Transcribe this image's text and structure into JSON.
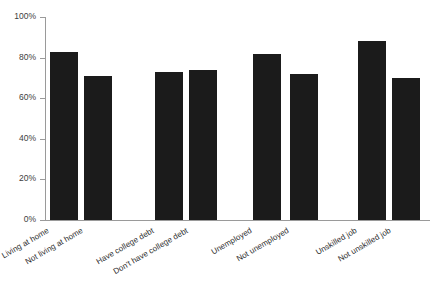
{
  "chart_data": {
    "type": "bar",
    "title": "",
    "subtitle": "",
    "xlabel": "",
    "ylabel": "",
    "ylim": [
      0,
      100
    ],
    "grid": false,
    "legend": "none",
    "bar_color": "#1b1b1b",
    "axis_color": "#9a9a9a",
    "value_suffix": "%",
    "categories": [
      "Living at home",
      "Not living at home",
      "Have college debt",
      "Don't have college debt",
      "Unemployed",
      "Not unemployed",
      "Unskilled job",
      "Not unskilled job"
    ],
    "values": [
      83,
      71,
      73,
      74,
      82,
      72,
      88,
      70
    ],
    "ytick_labels": [
      "100%",
      "80%",
      "60%",
      "40%",
      "20%",
      "0%"
    ],
    "ytick_values": [
      100,
      80,
      60,
      40,
      20,
      0
    ],
    "groups": [
      {
        "name": "housing",
        "categories": [
          "Living at home",
          "Not living at home"
        ]
      },
      {
        "name": "college-debt",
        "categories": [
          "Have college debt",
          "Don't have college debt"
        ]
      },
      {
        "name": "employment",
        "categories": [
          "Unemployed",
          "Not unemployed"
        ]
      },
      {
        "name": "job-skill",
        "categories": [
          "Unskilled job",
          "Not unskilled job"
        ]
      }
    ]
  },
  "layout": {
    "bar_left_positions": [
      50,
      84,
      155,
      189,
      253,
      290,
      358,
      392
    ],
    "bar_width": 28
  }
}
